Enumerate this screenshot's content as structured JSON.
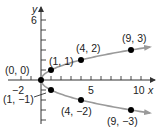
{
  "chart_data": {
    "type": "line",
    "title": "",
    "equation_shown": "",
    "xlabel": "x",
    "ylabel": "y",
    "xlim": [
      -3.3,
      11.5
    ],
    "ylim": [
      -4.4,
      7.2
    ],
    "grid": false,
    "legend": null,
    "x_tick_labels": [
      {
        "value": -2,
        "label": "−2"
      },
      {
        "value": 5,
        "label": "5"
      },
      {
        "value": 10,
        "label": "10"
      }
    ],
    "y_tick_labels": [
      {
        "value": 6,
        "label": "6"
      }
    ],
    "x_ticks": [
      -2,
      -1,
      1,
      2,
      3,
      4,
      5,
      6,
      7,
      8,
      9,
      10
    ],
    "y_ticks": [
      -4,
      -3,
      -2,
      -1,
      1,
      2,
      3,
      4,
      5,
      6
    ],
    "series": [
      {
        "name": "upper branch (y = √x)",
        "curve": "x = y^2, y >= 0",
        "color": "#9a9a9a",
        "x_range": [
          0,
          10.9
        ],
        "arrow_end": true
      },
      {
        "name": "lower branch (y = −√x)",
        "curve": "x = y^2, y <= 0",
        "color": "#9a9a9a",
        "x_range": [
          0,
          10.9
        ],
        "arrow_end": true
      }
    ],
    "points": [
      {
        "x": 0,
        "y": 0,
        "label": "(0, 0)"
      },
      {
        "x": 1,
        "y": 1,
        "label": "(1, 1)"
      },
      {
        "x": 4,
        "y": 2,
        "label": "(4, 2)"
      },
      {
        "x": 9,
        "y": 3,
        "label": "(9, 3)"
      },
      {
        "x": 1,
        "y": -1,
        "label": "(1, −1)"
      },
      {
        "x": 4,
        "y": -2,
        "label": "(4, −2)"
      },
      {
        "x": 9,
        "y": -3,
        "label": "(9, −3)"
      }
    ],
    "colors": {
      "axis": "#333333",
      "curve": "#9a9a9a",
      "point": "#000000"
    }
  }
}
